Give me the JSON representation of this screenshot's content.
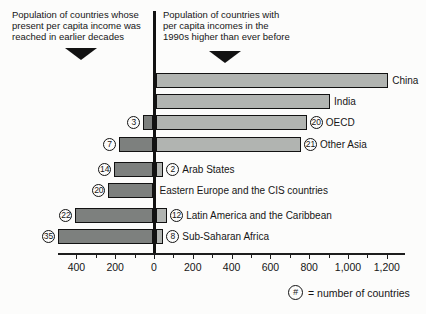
{
  "chart_data": {
    "type": "bar",
    "orientation": "horizontal-diverging",
    "unit": "population (millions, read from axis)",
    "left_header_lines": [
      "Population of countries whose",
      "present per capita income was",
      "reached in earlier decades"
    ],
    "right_header_lines": [
      "Population of countries with",
      "per capita incomes in the",
      "1990s higher than ever before"
    ],
    "rows": [
      {
        "label": "China",
        "left_value": 0,
        "left_count": null,
        "right_value": 1200,
        "right_count": null
      },
      {
        "label": "India",
        "left_value": 0,
        "left_count": null,
        "right_value": 900,
        "right_count": null
      },
      {
        "label": "OECD",
        "left_value": 50,
        "left_count": 3,
        "right_value": 780,
        "right_count": 20
      },
      {
        "label": "Other Asia",
        "left_value": 175,
        "left_count": 7,
        "right_value": 750,
        "right_count": 21
      },
      {
        "label": "Arab States",
        "left_value": 200,
        "left_count": 14,
        "right_value": 40,
        "right_count": 2
      },
      {
        "label": "Eastern Europe and the CIS countries",
        "left_value": 230,
        "left_count": 20,
        "right_value": 0,
        "right_count": null
      },
      {
        "label": "Latin America and the Caribbean",
        "left_value": 400,
        "left_count": 22,
        "right_value": 60,
        "right_count": 12
      },
      {
        "label": "Sub-Saharan Africa",
        "left_value": 490,
        "left_count": 35,
        "right_value": 40,
        "right_count": 8
      }
    ],
    "x_axis": {
      "tick_labels": [
        {
          "value": -400,
          "label": "400"
        },
        {
          "value": -200,
          "label": "200"
        },
        {
          "value": 0,
          "label": "0"
        },
        {
          "value": 200,
          "label": "200"
        },
        {
          "value": 400,
          "label": "400"
        },
        {
          "value": 600,
          "label": "600"
        },
        {
          "value": 800,
          "label": "800"
        },
        {
          "value": 1000,
          "label": "1,000"
        },
        {
          "value": 1200,
          "label": "1,200"
        }
      ],
      "minor_tick_step": 100,
      "range": [
        -500,
        1250
      ]
    },
    "legend": {
      "symbol": "#",
      "text": "= number of countries"
    },
    "colors": {
      "left_bar": "#7d807e",
      "right_bar": "#b1b4b1",
      "axis": "#121212",
      "background": "#fcfcfb"
    }
  }
}
